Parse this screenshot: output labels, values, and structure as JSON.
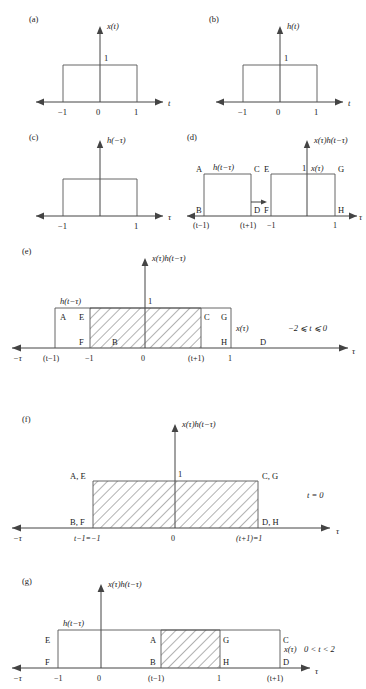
{
  "figure": {
    "type": "convolution-graphical-construction",
    "axis_color": "#444444",
    "box_color": "#555555",
    "hatch_color": "#666666"
  },
  "panels": [
    {
      "id": "a",
      "tag": "(a)",
      "yaxis_label": "x(t)",
      "xaxis_label": "t",
      "amplitude_label": "1",
      "ticks": [
        "−1",
        "0",
        "1"
      ],
      "pulse": {
        "from": -1,
        "to": 1,
        "height": 1
      }
    },
    {
      "id": "b",
      "tag": "(b)",
      "yaxis_label": "h(t)",
      "xaxis_label": "t",
      "amplitude_label": "1",
      "ticks": [
        "−1",
        "0",
        "1"
      ],
      "pulse": {
        "from": -1,
        "to": 1,
        "height": 1
      }
    },
    {
      "id": "c",
      "tag": "(c)",
      "yaxis_label": "h(−τ)",
      "xaxis_label": "τ",
      "ticks": [
        "−1",
        "1"
      ],
      "pulse": {
        "from": -1,
        "to": 1,
        "height": 1
      }
    },
    {
      "id": "d",
      "tag": "(d)",
      "yaxis_label": "x(τ)h(t−τ)",
      "xaxis_label": "τ",
      "curve_label_left": "h(t−τ)",
      "curve_label_right": "x(τ)",
      "amplitude_label": "1",
      "corner_labels": [
        "A",
        "B",
        "C",
        "D",
        "E",
        "F",
        "G",
        "H"
      ],
      "ticks": [
        "(t−1)",
        "(t+1)",
        "−1",
        "1"
      ],
      "arrow": "shift-right-arrow"
    },
    {
      "id": "e",
      "tag": "(e)",
      "yaxis_label": "x(τ)h(t−τ)",
      "xaxis_label": "τ",
      "xaxis_label_left": "−τ",
      "curve_label_left": "h(t−τ)",
      "curve_label_right": "x(τ)",
      "amplitude_label": "1",
      "corner_labels": [
        "A",
        "E",
        "C",
        "G",
        "F",
        "B",
        "H",
        "D"
      ],
      "ticks": [
        "(t−1)",
        "−1",
        "0",
        "(t+1)",
        "1"
      ],
      "condition": "−2 ⩽ t ⩽ 0",
      "overlap": {
        "from": -1,
        "to": "(t+1)"
      }
    },
    {
      "id": "f",
      "tag": "(f)",
      "yaxis_label": "x(τ)h(t−τ)",
      "xaxis_label": "τ",
      "xaxis_label_left": "−τ",
      "amplitude_label": "1",
      "corner_labels": [
        "A, E",
        "C, G",
        "B, F",
        "D, H"
      ],
      "ticks": [
        "t−1=−1",
        "0",
        "(t+1)=1"
      ],
      "condition": "t = 0",
      "overlap": {
        "from": -1,
        "to": 1
      }
    },
    {
      "id": "g",
      "tag": "(g)",
      "yaxis_label": "x(τ)h(t−τ)",
      "xaxis_label": "τ",
      "xaxis_label_left": "−τ",
      "curve_label_left": "h(t−τ)",
      "curve_label_right": "x(τ)",
      "corner_labels": [
        "E",
        "A",
        "G",
        "C",
        "F",
        "B",
        "H",
        "D"
      ],
      "ticks": [
        "−1",
        "0",
        "(t−1)",
        "1",
        "(t+1)"
      ],
      "condition": "0 < t < 2",
      "overlap": {
        "from": "(t−1)",
        "to": 1
      }
    }
  ]
}
